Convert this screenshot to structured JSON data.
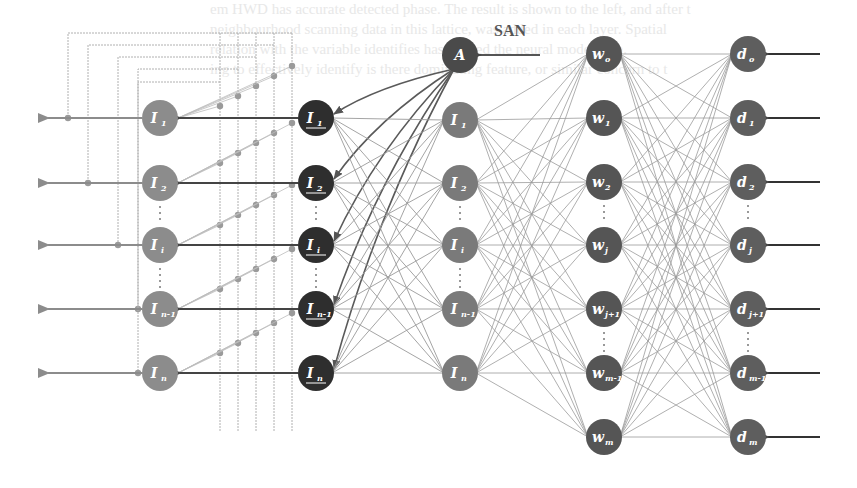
{
  "title": "",
  "colors": {
    "background": "#ffffff",
    "output_node": "#8c8c8c",
    "input_node_dark": "#2e2e2e",
    "hidden_node": "#7a7a7a",
    "attention_node": "#4a4a4a",
    "w_node": "#555555",
    "d_node": "#5e5e5e",
    "edge": "#9a9a9a",
    "edge_dark": "#5a5a5a",
    "feedback_line": "#b0b0b0",
    "dot": "#9a9a9a",
    "arrow": "#444444"
  },
  "annotation": {
    "san_label": "SAN"
  },
  "background_text": [
    "em HWD has accurate detected phase. The result is shown to the left, and after t",
    "neighbourhood scanning data in this lattice, was added in each layer. Spatial",
    "relation with the variable identifies has unified the neural model data.",
    "ing to effectively identify is there dominating feature, or similar concern to t"
  ],
  "layers": {
    "outputs": {
      "name": "output-layer",
      "nodes": [
        {
          "id": "I1",
          "base": "I",
          "sub": "1",
          "x": 160,
          "y": 118
        },
        {
          "id": "I2",
          "base": "I",
          "sub": "2",
          "x": 160,
          "y": 183
        },
        {
          "id": "Ii",
          "base": "I",
          "sub": "i",
          "x": 160,
          "y": 245
        },
        {
          "id": "In-1",
          "base": "I",
          "sub": "n-1",
          "x": 160,
          "y": 309
        },
        {
          "id": "In",
          "base": "I",
          "sub": "n",
          "x": 160,
          "y": 373
        }
      ]
    },
    "inputs": {
      "name": "input-layer-underlined",
      "nodes": [
        {
          "id": "uI1",
          "base": "I",
          "sub": "1",
          "x": 316,
          "y": 118
        },
        {
          "id": "uI2",
          "base": "I",
          "sub": "2",
          "x": 316,
          "y": 183
        },
        {
          "id": "uIi",
          "base": "I",
          "sub": "i",
          "x": 316,
          "y": 245
        },
        {
          "id": "uIn-1",
          "base": "I",
          "sub": "n-1",
          "x": 316,
          "y": 309
        },
        {
          "id": "uIn",
          "base": "I",
          "sub": "n",
          "x": 316,
          "y": 373
        }
      ]
    },
    "attention": {
      "name": "attention-node",
      "nodes": [
        {
          "id": "A",
          "base": "A",
          "sub": "",
          "x": 460,
          "y": 55
        }
      ]
    },
    "hidden": {
      "name": "hidden-layer",
      "nodes": [
        {
          "id": "hI1",
          "base": "I",
          "sub": "1",
          "x": 460,
          "y": 120
        },
        {
          "id": "hI2",
          "base": "I",
          "sub": "2",
          "x": 460,
          "y": 183
        },
        {
          "id": "hIi",
          "base": "I",
          "sub": "i",
          "x": 460,
          "y": 245
        },
        {
          "id": "hIn-1",
          "base": "I",
          "sub": "n-1",
          "x": 460,
          "y": 309
        },
        {
          "id": "hIn",
          "base": "I",
          "sub": "n",
          "x": 460,
          "y": 373
        }
      ]
    },
    "weights": {
      "name": "weight-layer",
      "nodes": [
        {
          "id": "w0",
          "base": "w",
          "sub": "o",
          "x": 604,
          "y": 54
        },
        {
          "id": "w1",
          "base": "w",
          "sub": "1",
          "x": 604,
          "y": 118
        },
        {
          "id": "w2",
          "base": "w",
          "sub": "2",
          "x": 604,
          "y": 182
        },
        {
          "id": "wj",
          "base": "w",
          "sub": "j",
          "x": 604,
          "y": 245
        },
        {
          "id": "wj+1",
          "base": "w",
          "sub": "j+1",
          "x": 604,
          "y": 309
        },
        {
          "id": "wm-1",
          "base": "w",
          "sub": "m-1",
          "x": 604,
          "y": 373
        },
        {
          "id": "wm",
          "base": "w",
          "sub": "m",
          "x": 604,
          "y": 437
        }
      ]
    },
    "desired": {
      "name": "desired-layer",
      "nodes": [
        {
          "id": "d0",
          "base": "d",
          "sub": "o",
          "x": 748,
          "y": 54
        },
        {
          "id": "d1",
          "base": "d",
          "sub": "1",
          "x": 748,
          "y": 118
        },
        {
          "id": "d2",
          "base": "d",
          "sub": "2",
          "x": 748,
          "y": 182
        },
        {
          "id": "dj",
          "base": "d",
          "sub": "j",
          "x": 748,
          "y": 245
        },
        {
          "id": "dj+1",
          "base": "d",
          "sub": "j+1",
          "x": 748,
          "y": 309
        },
        {
          "id": "dm-1",
          "base": "d",
          "sub": "m-1",
          "x": 748,
          "y": 373
        },
        {
          "id": "dm",
          "base": "d",
          "sub": "m",
          "x": 748,
          "y": 437
        }
      ]
    }
  },
  "node_radius": 18
}
